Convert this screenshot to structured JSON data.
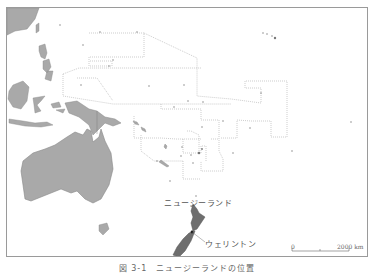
{
  "figure": {
    "caption": "図 3-1　ニュージーランドの位置",
    "colors": {
      "land_other": "#a9a9a9",
      "land_nz": "#6e6e6e",
      "boundary": "#9a9a9a",
      "frame": "#9a9a9a"
    }
  },
  "map": {
    "labels": {
      "country": "ニュージーランド",
      "capital": "ウェリントン"
    },
    "scale_bar": {
      "start": "0",
      "end": "2000 km"
    }
  }
}
